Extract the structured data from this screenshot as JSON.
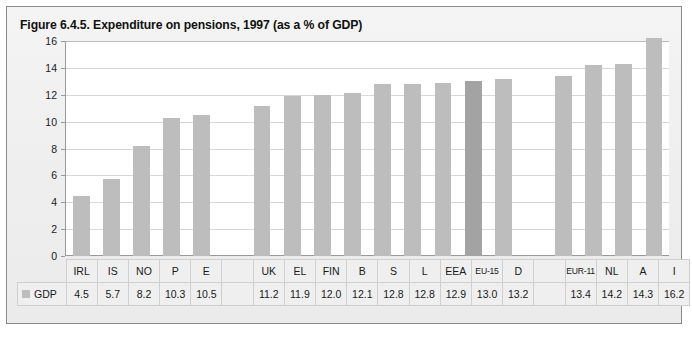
{
  "figure": {
    "title": "Figure 6.4.5. Expenditure on pensions, 1997 (as a % of GDP)",
    "legend_label": "GDP",
    "legend_swatch_color": "#bdbdbd"
  },
  "colors": {
    "bar": "#bdbdbd",
    "bar_highlight": "#a3a3a3",
    "plot_background": "#ffffff",
    "panel_background": "#f0f0f0",
    "gridline": "#d8d8d8",
    "axis": "#9a9a9a",
    "table_cell_background": "#efefef",
    "table_border": "#cfcfcf",
    "text": "#1a1a1a"
  },
  "chart_data": {
    "type": "bar",
    "title": "Figure 6.4.5. Expenditure on pensions, 1997 (as a % of GDP)",
    "xlabel": "",
    "ylabel": "",
    "ylim": [
      0,
      16
    ],
    "yticks": [
      0,
      2,
      4,
      6,
      8,
      10,
      12,
      14,
      16
    ],
    "grid": true,
    "legend_position": "table-row-header",
    "series": [
      {
        "name": "GDP",
        "categories": [
          "IRL",
          "IS",
          "NO",
          "P",
          "E",
          "",
          "UK",
          "EL",
          "FIN",
          "B",
          "S",
          "L",
          "EEA",
          "EU-15",
          "D",
          "",
          "EUR-11",
          "NL",
          "A",
          "I"
        ],
        "values": [
          4.5,
          5.7,
          8.2,
          10.3,
          10.5,
          null,
          11.2,
          11.9,
          12.0,
          12.1,
          12.8,
          12.8,
          12.9,
          13.0,
          13.2,
          null,
          13.4,
          14.2,
          14.3,
          16.2
        ],
        "highlight_categories": [
          "EU-15"
        ]
      }
    ]
  },
  "columns": [
    {
      "label": "IRL",
      "value": "4.5",
      "num": 4.5,
      "highlight": false,
      "blank": false,
      "narrow": false
    },
    {
      "label": "IS",
      "value": "5.7",
      "num": 5.7,
      "highlight": false,
      "blank": false,
      "narrow": false
    },
    {
      "label": "NO",
      "value": "8.2",
      "num": 8.2,
      "highlight": false,
      "blank": false,
      "narrow": false
    },
    {
      "label": "P",
      "value": "10.3",
      "num": 10.3,
      "highlight": false,
      "blank": false,
      "narrow": false
    },
    {
      "label": "E",
      "value": "10.5",
      "num": 10.5,
      "highlight": false,
      "blank": false,
      "narrow": false
    },
    {
      "label": "",
      "value": "",
      "num": null,
      "highlight": false,
      "blank": true,
      "narrow": false
    },
    {
      "label": "UK",
      "value": "11.2",
      "num": 11.2,
      "highlight": false,
      "blank": false,
      "narrow": false
    },
    {
      "label": "EL",
      "value": "11.9",
      "num": 11.9,
      "highlight": false,
      "blank": false,
      "narrow": false
    },
    {
      "label": "FIN",
      "value": "12.0",
      "num": 12.0,
      "highlight": false,
      "blank": false,
      "narrow": false
    },
    {
      "label": "B",
      "value": "12.1",
      "num": 12.1,
      "highlight": false,
      "blank": false,
      "narrow": false
    },
    {
      "label": "S",
      "value": "12.8",
      "num": 12.8,
      "highlight": false,
      "blank": false,
      "narrow": false
    },
    {
      "label": "L",
      "value": "12.8",
      "num": 12.8,
      "highlight": false,
      "blank": false,
      "narrow": false
    },
    {
      "label": "EEA",
      "value": "12.9",
      "num": 12.9,
      "highlight": false,
      "blank": false,
      "narrow": false
    },
    {
      "label": "EU-15",
      "value": "13.0",
      "num": 13.0,
      "highlight": true,
      "blank": false,
      "narrow": true
    },
    {
      "label": "D",
      "value": "13.2",
      "num": 13.2,
      "highlight": false,
      "blank": false,
      "narrow": false
    },
    {
      "label": "",
      "value": "",
      "num": null,
      "highlight": false,
      "blank": true,
      "narrow": false
    },
    {
      "label": "EUR-11",
      "value": "13.4",
      "num": 13.4,
      "highlight": false,
      "blank": false,
      "narrow": true
    },
    {
      "label": "NL",
      "value": "14.2",
      "num": 14.2,
      "highlight": false,
      "blank": false,
      "narrow": false
    },
    {
      "label": "A",
      "value": "14.3",
      "num": 14.3,
      "highlight": false,
      "blank": false,
      "narrow": false
    },
    {
      "label": "I",
      "value": "16.2",
      "num": 16.2,
      "highlight": false,
      "blank": false,
      "narrow": false
    }
  ],
  "y_axis": {
    "ticks": [
      "16",
      "14",
      "12",
      "10",
      "8",
      "6",
      "4",
      "2",
      "0"
    ]
  }
}
